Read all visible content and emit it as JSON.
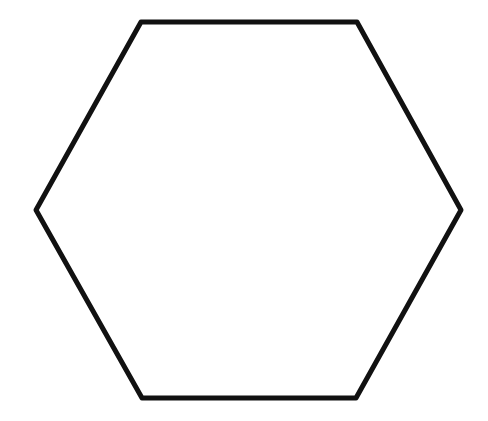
{
  "diagram": {
    "shape": "hexagon",
    "orientation": "flat-top",
    "stroke_color": "#111111",
    "fill_color": "#ffffff",
    "stroke_width": 5,
    "vertices": [
      [
        141,
        22
      ],
      [
        357,
        22
      ],
      [
        461,
        210
      ],
      [
        356,
        398
      ],
      [
        142,
        398
      ],
      [
        36,
        210
      ]
    ]
  }
}
